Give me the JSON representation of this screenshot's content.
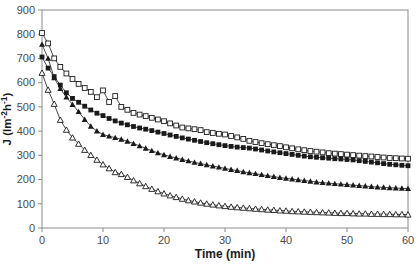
{
  "chart_data": {
    "type": "line",
    "title": "",
    "xlabel": "Time (min)",
    "ylabel": "J (lm-2h-1)",
    "ylabel_segments": [
      {
        "text": "J (lm",
        "sup": false
      },
      {
        "text": "-2",
        "sup": true
      },
      {
        "text": "h",
        "sup": false
      },
      {
        "text": "-1",
        "sup": true
      },
      {
        "text": ")",
        "sup": false
      }
    ],
    "xlim": [
      0,
      60
    ],
    "ylim": [
      0,
      900
    ],
    "x_ticks": [
      0,
      10,
      20,
      30,
      40,
      50,
      60
    ],
    "y_ticks": [
      0,
      100,
      200,
      300,
      400,
      500,
      600,
      700,
      800,
      900
    ],
    "grid": false,
    "legend": "none",
    "x": [
      0,
      1,
      2,
      3,
      4,
      5,
      6,
      7,
      8,
      9,
      10,
      11,
      12,
      13,
      14,
      15,
      16,
      17,
      18,
      19,
      20,
      21,
      22,
      23,
      24,
      25,
      26,
      27,
      28,
      29,
      30,
      31,
      32,
      33,
      34,
      35,
      36,
      37,
      38,
      39,
      40,
      41,
      42,
      43,
      44,
      45,
      46,
      47,
      48,
      49,
      50,
      51,
      52,
      53,
      54,
      55,
      56,
      57,
      58,
      59,
      60
    ],
    "series": [
      {
        "name": "open-square-series",
        "marker": "square",
        "fill": "open",
        "values": [
          805,
          762,
          700,
          665,
          638,
          615,
          595,
          578,
          562,
          540,
          568,
          520,
          545,
          500,
          488,
          475,
          468,
          462,
          455,
          448,
          441,
          432,
          423,
          415,
          411,
          408,
          404,
          396,
          392,
          389,
          386,
          380,
          374,
          368,
          360,
          355,
          350,
          346,
          342,
          338,
          333,
          329,
          325,
          321,
          318,
          315,
          312,
          309,
          307,
          305,
          303,
          301,
          299,
          297,
          295,
          293,
          291,
          289,
          288,
          287,
          286
        ]
      },
      {
        "name": "filled-square-series",
        "marker": "square",
        "fill": "solid",
        "values": [
          706,
          660,
          625,
          590,
          558,
          535,
          519,
          503,
          487,
          474,
          464,
          452,
          442,
          433,
          426,
          419,
          413,
          408,
          402,
          396,
          390,
          384,
          378,
          372,
          367,
          362,
          357,
          352,
          348,
          344,
          340,
          337,
          334,
          332,
          330,
          326,
          322,
          318,
          314,
          311,
          307,
          304,
          300,
          297,
          294,
          292,
          290,
          288,
          286,
          285,
          283,
          281,
          278,
          275,
          272,
          269,
          266,
          263,
          261,
          259,
          257
        ]
      },
      {
        "name": "filled-triangle-series",
        "marker": "triangle",
        "fill": "solid",
        "values": [
          758,
          700,
          620,
          575,
          540,
          510,
          480,
          448,
          420,
          400,
          386,
          379,
          373,
          366,
          358,
          349,
          339,
          329,
          319,
          310,
          302,
          295,
          289,
          283,
          277,
          271,
          266,
          261,
          256,
          251,
          246,
          241,
          237,
          232,
          228,
          224,
          220,
          216,
          212,
          208,
          205,
          202,
          199,
          196,
          193,
          190,
          187,
          185,
          183,
          181,
          179,
          177,
          175,
          173,
          171,
          169,
          168,
          166,
          165,
          164,
          163
        ]
      },
      {
        "name": "open-triangle-series",
        "marker": "triangle",
        "fill": "open",
        "values": [
          640,
          570,
          512,
          446,
          405,
          373,
          347,
          322,
          301,
          281,
          262,
          246,
          230,
          222,
          210,
          196,
          184,
          172,
          161,
          151,
          142,
          134,
          127,
          120,
          114,
          109,
          104,
          100,
          96,
          93,
          90,
          87,
          85,
          83,
          81,
          79,
          77,
          75,
          74,
          72,
          71,
          69,
          68,
          67,
          66,
          65,
          64,
          63,
          62,
          61,
          61,
          60,
          59,
          59,
          58,
          58,
          57,
          57,
          56,
          56,
          55
        ]
      }
    ],
    "colors": {
      "background": "#ffffff",
      "frame": "#8c8c8c",
      "tick_text": "#4a4a4a",
      "label_text": "#1a1a1a",
      "line": "#1a1a1a",
      "marker_open_fill": "#ffffff"
    }
  }
}
